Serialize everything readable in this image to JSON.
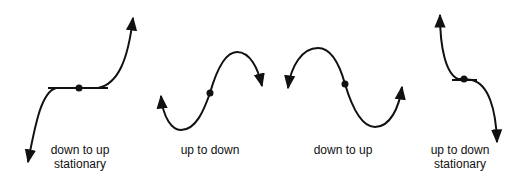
{
  "diagram": {
    "stroke_color": "#111111",
    "panels": [
      {
        "id": "down-to-up-stationary",
        "label_line1": "down to up",
        "label_line2": "stationary",
        "point_type": "stationary point of inflection",
        "gradient_change": "down to up"
      },
      {
        "id": "up-to-down",
        "label_line1": "up to down",
        "label_line2": "",
        "point_type": "non-stationary point of inflection",
        "gradient_change": "up to down"
      },
      {
        "id": "down-to-up",
        "label_line1": "down to up",
        "label_line2": "",
        "point_type": "non-stationary point of inflection",
        "gradient_change": "down to up"
      },
      {
        "id": "up-to-down-stationary",
        "label_line1": "up to down",
        "label_line2": "stationary",
        "point_type": "stationary point of inflection",
        "gradient_change": "up to down"
      }
    ]
  }
}
